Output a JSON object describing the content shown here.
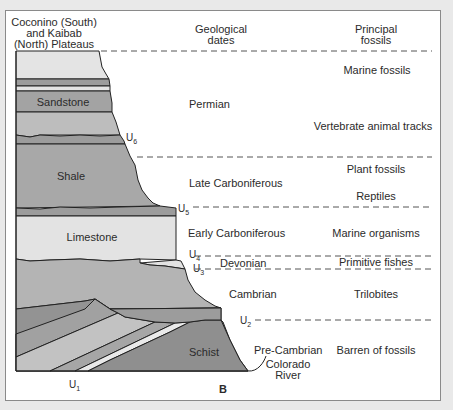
{
  "figure_label": "B",
  "headers": {
    "column": "Coconino (South) and Kaibab (North) Plateaus",
    "column_lines": [
      "Coconino (South)",
      "and Kaibab",
      "(North) Plateaus"
    ],
    "dates_lines": [
      "Geological",
      "dates"
    ],
    "fossils_lines": [
      "Principal",
      "fossils"
    ]
  },
  "rock_labels": {
    "sandstone": "Sandstone",
    "shale": "Shale",
    "limestone": "Limestone",
    "schist": "Schist"
  },
  "unconformities": {
    "u1": {
      "base": "U",
      "sub": "1"
    },
    "u2": {
      "base": "U",
      "sub": "2"
    },
    "u3": {
      "base": "U",
      "sub": "3"
    },
    "u4": {
      "base": "U",
      "sub": "4"
    },
    "u5": {
      "base": "U",
      "sub": "5"
    },
    "u6": {
      "base": "U",
      "sub": "6"
    }
  },
  "periods": {
    "permian": "Permian",
    "late_carboniferous": "Late Carboniferous",
    "early_carboniferous": "Early Carboniferous",
    "devonian": "Devonian",
    "cambrian": "Cambrian",
    "pre_cambrian": "Pre-Cambrian"
  },
  "fossils": {
    "marine_fossils": "Marine fossils",
    "vertebrate_tracks": "Vertebrate animal tracks",
    "plant_fossils": "Plant fossils",
    "reptiles": "Reptiles",
    "marine_organisms": "Marine organisms",
    "primitive_fishes": "Primitive fishes",
    "trilobites": "Trilobites",
    "barren": "Barren of fossils"
  },
  "river_label_lines": [
    "Colorado",
    "River"
  ],
  "colors": {
    "lightest": "#e6e6e6",
    "light": "#c9c9c9",
    "mid": "#b3b3b3",
    "dark": "#9a9a9a",
    "darker": "#8c8c8c",
    "outline": "#222222",
    "dash": "#555555"
  }
}
